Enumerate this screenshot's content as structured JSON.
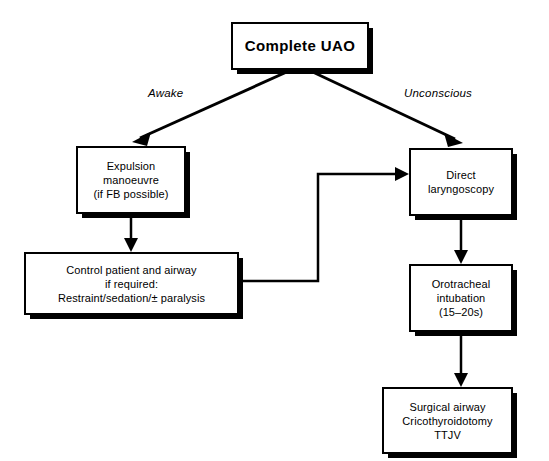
{
  "diagram": {
    "title_node": {
      "id": "complete-uao",
      "label": "Complete UAO",
      "x": 231,
      "y": 22,
      "w": 138,
      "h": 48
    },
    "nodes": [
      {
        "id": "expulsion-manoeuvre",
        "label": "Expulsion\nmanoeuvre\n(if FB possible)",
        "x": 76,
        "y": 146,
        "w": 110,
        "h": 68
      },
      {
        "id": "direct-laryngoscopy",
        "label": "Direct\nlaryngoscopy",
        "x": 409,
        "y": 148,
        "w": 104,
        "h": 68
      },
      {
        "id": "control-patient-airway",
        "label": "Control patient and airway\nif required:\nRestraint/sedation/± paralysis",
        "x": 24,
        "y": 252,
        "w": 215,
        "h": 63
      },
      {
        "id": "orotracheal-intubation",
        "label": "Orotracheal\nintubation\n(15–20s)",
        "x": 409,
        "y": 264,
        "w": 104,
        "h": 68
      },
      {
        "id": "surgical-airway",
        "label": "Surgical airway\nCricothyroidotomy\nTTJV",
        "x": 382,
        "y": 387,
        "w": 131,
        "h": 67
      }
    ],
    "edge_labels": [
      {
        "id": "awake",
        "text": "Awake",
        "x": 148,
        "y": 87
      },
      {
        "id": "unconscious",
        "text": "Unconscious",
        "x": 404,
        "y": 87
      }
    ],
    "edges": [
      {
        "id": "uao-to-expulsion",
        "from": "complete-uao",
        "to": "expulsion-manoeuvre",
        "kind": "diagonal"
      },
      {
        "id": "uao-to-laryngoscopy",
        "from": "complete-uao",
        "to": "direct-laryngoscopy",
        "kind": "diagonal"
      },
      {
        "id": "expulsion-to-control",
        "from": "expulsion-manoeuvre",
        "to": "control-patient-airway",
        "kind": "vertical"
      },
      {
        "id": "control-to-laryngoscopy",
        "from": "control-patient-airway",
        "to": "direct-laryngoscopy",
        "kind": "orthogonal"
      },
      {
        "id": "laryngoscopy-to-intubation",
        "from": "direct-laryngoscopy",
        "to": "orotracheal-intubation",
        "kind": "vertical"
      },
      {
        "id": "intubation-to-surgical",
        "from": "orotracheal-intubation",
        "to": "surgical-airway",
        "kind": "vertical"
      }
    ],
    "colors": {
      "stroke": "#000000",
      "fill": "#ffffff",
      "shadow": "#000000"
    }
  }
}
